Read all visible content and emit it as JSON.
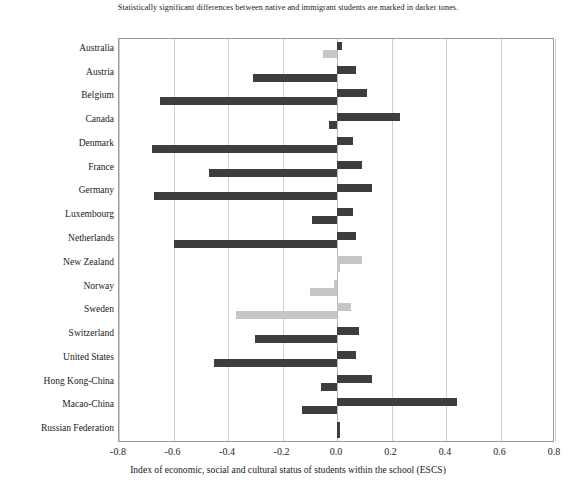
{
  "chart_data": {
    "type": "bar",
    "orientation": "horizontal",
    "title": "Statistically significant differences between native and immigrant students are marked in darker tones.",
    "xlabel": "Index of economic, social and cultural status of students within the school (ESCS)",
    "ylabel": "",
    "xlim": [
      -0.8,
      0.8
    ],
    "xticks": [
      -0.8,
      -0.6,
      -0.4,
      -0.2,
      0.0,
      0.2,
      0.4,
      0.6,
      0.8
    ],
    "xtick_labels": [
      "-0.8",
      "-0.6",
      "-0.4",
      "-0.2",
      "0.0",
      "0.2",
      "0.4",
      "0.6",
      "0.8"
    ],
    "grid": true,
    "legend": "none",
    "colors": {
      "significant": "#3d3d3d",
      "not_significant": "#c6c6c6"
    },
    "categories": [
      "Australia",
      "Austria",
      "Belgium",
      "Canada",
      "Denmark",
      "France",
      "Germany",
      "Luxembourg",
      "Netherlands",
      "New Zealand",
      "Norway",
      "Sweden",
      "Switzerland",
      "United States",
      "Hong Kong-China",
      "Macao-China",
      "Russian Federation"
    ],
    "series": [
      {
        "name": "First-generation students",
        "values": [
          0.02,
          0.07,
          0.11,
          0.23,
          0.06,
          0.09,
          0.13,
          0.06,
          0.07,
          0.09,
          -0.01,
          0.05,
          0.08,
          0.07,
          0.13,
          0.44,
          0.01
        ],
        "significant": [
          true,
          true,
          true,
          true,
          true,
          true,
          true,
          true,
          true,
          false,
          false,
          false,
          true,
          true,
          true,
          true,
          true
        ]
      },
      {
        "name": "Second-generation students",
        "values": [
          -0.05,
          -0.31,
          -0.65,
          -0.03,
          -0.68,
          -0.47,
          -0.67,
          -0.09,
          -0.6,
          0.01,
          -0.1,
          -0.37,
          -0.3,
          -0.45,
          -0.06,
          -0.13,
          0.0
        ],
        "significant": [
          false,
          true,
          true,
          true,
          true,
          true,
          true,
          true,
          true,
          false,
          false,
          false,
          true,
          true,
          true,
          true,
          true
        ]
      }
    ]
  }
}
